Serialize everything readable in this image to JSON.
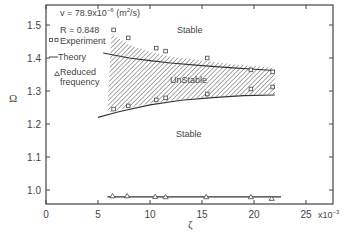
{
  "chart_data": {
    "type": "line",
    "title": "",
    "xlabel": "ζ",
    "ylabel": "Ω",
    "x_multiplier": "x10⁻³",
    "xlim": [
      0,
      27.5
    ],
    "ylim": [
      0.96,
      1.56
    ],
    "xticks": [
      0,
      5,
      10,
      15,
      20,
      25
    ],
    "xtick_labels": [
      "0",
      "5",
      "10",
      "15",
      "20",
      "25"
    ],
    "yticks": [
      1.0,
      1.1,
      1.2,
      1.3,
      1.4,
      1.5
    ],
    "ytick_labels": [
      "1.0",
      "1.1",
      "1.2",
      "1.3",
      "1.4",
      "1.5"
    ],
    "grid": false,
    "annotations": {
      "nu": "v = 78.9x10",
      "nu_exp": "−6",
      "nu_unit": " (m",
      "nu_unit_exp": "2",
      "nu_unit_end": "/s)",
      "R": "R = 0.848",
      "region_upper": "Stable",
      "region_middle": "UnStable",
      "region_lower": "Stable"
    },
    "legend": {
      "position": "upper-left",
      "entries": [
        {
          "marker": "square",
          "label": "Experiment"
        },
        {
          "marker": "line",
          "label": "Theory"
        },
        {
          "marker": "triangle",
          "label": "Reduced frequency",
          "label_line1": "Reduced",
          "label_line2": "frequency"
        }
      ]
    },
    "series": [
      {
        "name": "Experiment (upper boundary)",
        "marker": "square",
        "x": [
          6.5,
          7.9,
          10.6,
          11.5,
          15.5,
          19.7,
          21.8
        ],
        "y": [
          1.485,
          1.461,
          1.43,
          1.421,
          1.4,
          1.364,
          1.358
        ]
      },
      {
        "name": "Experiment (lower boundary)",
        "marker": "square",
        "x": [
          6.5,
          7.9,
          10.6,
          11.5,
          15.5,
          19.7,
          21.8
        ],
        "y": [
          1.245,
          1.255,
          1.273,
          1.279,
          1.291,
          1.306,
          1.312
        ]
      },
      {
        "name": "Theory (upper)",
        "marker": "line",
        "x": [
          5.5,
          8,
          10,
          12,
          15,
          18,
          20,
          22
        ],
        "y": [
          1.415,
          1.4,
          1.392,
          1.385,
          1.377,
          1.37,
          1.366,
          1.362
        ]
      },
      {
        "name": "Theory (lower)",
        "marker": "line",
        "x": [
          5,
          7,
          10,
          13,
          16,
          19,
          22
        ],
        "y": [
          1.22,
          1.237,
          1.258,
          1.272,
          1.28,
          1.286,
          1.288
        ]
      },
      {
        "name": "Reduced frequency",
        "marker": "triangle",
        "x": [
          6.4,
          7.8,
          10.5,
          11.5,
          15.4,
          19.7,
          21.7
        ],
        "y": [
          0.982,
          0.982,
          0.98,
          0.979,
          0.979,
          0.979,
          0.974
        ]
      },
      {
        "name": "Reduced frequency (theory)",
        "marker": "line",
        "x": [
          5.9,
          22.6
        ],
        "y": [
          0.979,
          0.979
        ]
      }
    ],
    "unstable_region": {
      "upper": {
        "x": [
          6.3,
          8,
          10,
          12,
          15,
          18,
          22
        ],
        "y": [
          1.473,
          1.44,
          1.418,
          1.404,
          1.392,
          1.381,
          1.37
        ]
      },
      "lower": {
        "x": [
          5.9,
          8,
          10,
          13,
          16,
          19,
          22
        ],
        "y": [
          1.235,
          1.25,
          1.262,
          1.274,
          1.282,
          1.288,
          1.29
        ]
      }
    }
  }
}
